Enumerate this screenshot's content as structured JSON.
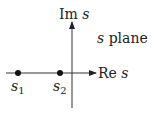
{
  "diagram": {
    "title": "s plane",
    "axes": {
      "real_label_prefix": "Re ",
      "real_label_var": "s",
      "imag_label_prefix": "Im ",
      "imag_label_var": "s"
    },
    "points": [
      {
        "name": "s",
        "subscript": "1"
      },
      {
        "name": "s",
        "subscript": "2"
      }
    ],
    "plane_label_var": "s",
    "plane_label_word": " plane",
    "colors": {
      "ink": "#222222",
      "background": "#ffffff"
    }
  }
}
